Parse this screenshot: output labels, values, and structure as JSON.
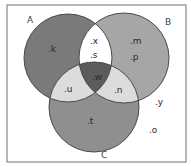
{
  "diagram": {
    "type": "venn-3",
    "frame": {
      "x": 7,
      "y": 5,
      "width": 179,
      "height": 157,
      "stroke": "#888888"
    },
    "sets": [
      {
        "id": "A",
        "label": "A",
        "cx": 68,
        "cy": 58,
        "r": 44,
        "label_x": 27,
        "label_y": 23
      },
      {
        "id": "B",
        "label": "B",
        "cx": 124,
        "cy": 58,
        "r": 45,
        "label_x": 165,
        "label_y": 25
      },
      {
        "id": "C",
        "label": "C",
        "cx": 94,
        "cy": 107,
        "r": 45,
        "label_x": 101,
        "label_y": 158
      }
    ],
    "regions": {
      "A_only": {
        "color": "#7a7a7a",
        "elements": [
          "k"
        ]
      },
      "B_only": {
        "color": "#a6a6a6",
        "elements": [
          "m",
          "p"
        ]
      },
      "C_only": {
        "color": "#8f8f8f",
        "elements": [
          "t"
        ]
      },
      "A_and_B": {
        "color": "#ffffff",
        "elements": [
          "x",
          "s"
        ]
      },
      "A_and_C": {
        "color": "#dcdcdc",
        "elements": [
          "u"
        ]
      },
      "B_and_C": {
        "color": "#dcdcdc",
        "elements": [
          "n"
        ]
      },
      "A_B_C": {
        "color": "#5c5c5c",
        "elements": [
          "w"
        ]
      },
      "outside": {
        "color": "#ffffff",
        "elements": [
          "y",
          "o"
        ]
      }
    },
    "element_labels": [
      {
        "text": ".k",
        "x": 48,
        "y": 52,
        "region": "A_only"
      },
      {
        "text": ".x",
        "x": 90,
        "y": 44,
        "region": "A_and_B"
      },
      {
        "text": ".s",
        "x": 90,
        "y": 58,
        "region": "A_and_B"
      },
      {
        "text": ".m",
        "x": 130,
        "y": 44,
        "region": "B_only"
      },
      {
        "text": ".p",
        "x": 130,
        "y": 60,
        "region": "B_only"
      },
      {
        "text": ".w",
        "x": 92,
        "y": 80,
        "region": "A_B_C"
      },
      {
        "text": ".u",
        "x": 64,
        "y": 92,
        "region": "A_and_C"
      },
      {
        "text": ".n",
        "x": 114,
        "y": 93,
        "region": "B_and_C"
      },
      {
        "text": ".t",
        "x": 87,
        "y": 124,
        "region": "C_only"
      },
      {
        "text": ".y",
        "x": 155,
        "y": 105,
        "region": "outside"
      },
      {
        "text": ".o",
        "x": 149,
        "y": 133,
        "region": "outside"
      }
    ],
    "outline_color": "#4a4a4a"
  }
}
